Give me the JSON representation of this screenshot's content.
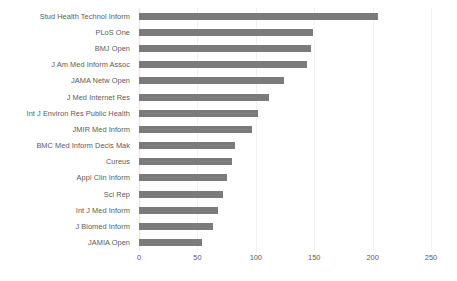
{
  "chart_data": {
    "type": "bar",
    "orientation": "horizontal",
    "title": "",
    "xlabel": "",
    "ylabel": "",
    "xlim": [
      0,
      250
    ],
    "xticks": [
      0,
      50,
      100,
      150,
      200,
      250
    ],
    "grid": true,
    "legend": false,
    "bar_color": "#7b7b7b",
    "categories": [
      "Stud Health Technol Inform",
      "PLoS One",
      "BMJ Open",
      "J Am Med Inform Assoc",
      "JAMA Netw Open",
      "J Med Internet Res",
      "Int J Environ Res Public Health",
      "JMIR Med Inform",
      "BMC Med Inform Decis Mak",
      "Cureus",
      "Appl Clin Inform",
      "Sci Rep",
      "Int J Med Inform",
      "J Biomed Inform",
      "JAMIA Open"
    ],
    "values": [
      205,
      149,
      147,
      144,
      124,
      111,
      102,
      97,
      82,
      80,
      75,
      72,
      68,
      63,
      54
    ]
  }
}
